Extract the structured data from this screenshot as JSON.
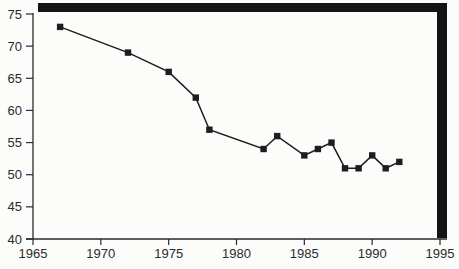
{
  "chart_data": {
    "type": "line",
    "title": "",
    "xlabel": "",
    "ylabel": "",
    "x": [
      1967,
      1972,
      1975,
      1977,
      1978,
      1982,
      1983,
      1985,
      1986,
      1987,
      1988,
      1989,
      1990,
      1991,
      1992
    ],
    "values": [
      73,
      69,
      66,
      62,
      57,
      54,
      56,
      53,
      54,
      55,
      51,
      51,
      53,
      51,
      52
    ],
    "xlim": [
      1965,
      1995
    ],
    "ylim": [
      40,
      75
    ],
    "x_ticks": [
      "1965",
      "1970",
      "1975",
      "1980",
      "1985",
      "1990",
      "1995"
    ],
    "x_tick_values": [
      1965,
      1970,
      1975,
      1980,
      1985,
      1990,
      1995
    ],
    "y_ticks": [
      "40",
      "45",
      "50",
      "55",
      "60",
      "65",
      "70",
      "75"
    ],
    "y_tick_values": [
      40,
      45,
      50,
      55,
      60,
      65,
      70,
      75
    ],
    "grid": false,
    "legend": null,
    "marker": "filled-square",
    "line_color": "#1d1d1d",
    "marker_color": "#1d1d1d",
    "axis_color": "#2b2b2b",
    "frame_color": "#141414",
    "frame_style": "thick-top-and-right-shadow-box",
    "background_color": "#fcfcfa"
  }
}
